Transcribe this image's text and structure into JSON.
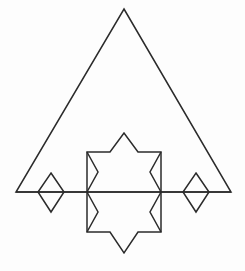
{
  "figure": {
    "background_color": "#fdfdfd",
    "stroke_color": "#2b2b2b",
    "stroke_width": 1.5,
    "canvas": {
      "width": 245,
      "height": 271
    },
    "shapes": [
      {
        "name": "outer-triangle",
        "type": "polygon",
        "label": "Outer isosceles triangle",
        "points": "124,9 231,192 16,192",
        "closed": true
      },
      {
        "name": "baseline",
        "type": "polyline",
        "label": "Horizontal baseline",
        "points": "16,192 231,192",
        "closed": false
      },
      {
        "name": "upper-star-half",
        "type": "polyline",
        "label": "Upper half of six-pointed star",
        "points": "87,192 87,152 110,152 124,133 138,152 161,152 161,192",
        "closed": false
      },
      {
        "name": "upper-star-left-notch",
        "type": "polyline",
        "label": "Upper star left notch",
        "points": "87,152 98,172 87,192",
        "closed": false
      },
      {
        "name": "upper-star-right-notch",
        "type": "polyline",
        "label": "Upper star right notch",
        "points": "161,152 150,172 161,192",
        "closed": false
      },
      {
        "name": "lower-star-half",
        "type": "polyline",
        "label": "Lower half of six-pointed star",
        "points": "87,192 87,232 110,232 124,253 138,232 161,232 161,192",
        "closed": false
      },
      {
        "name": "lower-star-left-notch",
        "type": "polyline",
        "label": "Lower star left notch",
        "points": "87,232 98,212 87,192",
        "closed": false
      },
      {
        "name": "lower-star-right-notch",
        "type": "polyline",
        "label": "Lower star right notch",
        "points": "161,232 150,212 161,192",
        "closed": false
      },
      {
        "name": "left-diamond",
        "type": "polygon",
        "label": "Left diamond",
        "points": "51,173 64,192 51,212 38,192",
        "closed": true
      },
      {
        "name": "right-diamond",
        "type": "polygon",
        "label": "Right diamond",
        "points": "196,173 209,192 196,212 183,192",
        "closed": true
      }
    ]
  }
}
